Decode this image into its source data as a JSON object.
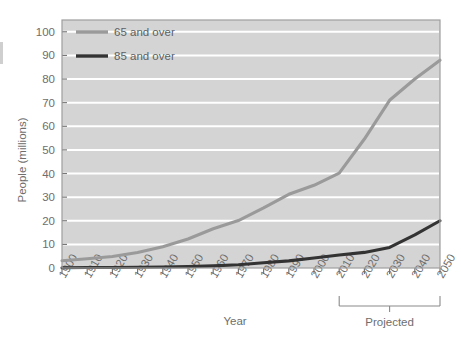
{
  "chart_data": {
    "type": "line",
    "title": "",
    "subtitle": "",
    "xlabel": "Year",
    "ylabel": "People (millions)",
    "xlim": [
      1900,
      2050
    ],
    "ylim": [
      0,
      105
    ],
    "ytick_step": 10,
    "grid": "horizontal-white",
    "legend_position": "top-left-inside",
    "plot_background": "#d4d4d4",
    "x": [
      1900,
      1910,
      1920,
      1930,
      1940,
      1950,
      1960,
      1970,
      1980,
      1990,
      2000,
      2010,
      2020,
      2030,
      2040,
      2050
    ],
    "xtick_labels": [
      "1900",
      "1910",
      "1920",
      "1930",
      "1940",
      "1950",
      "1960",
      "1970",
      "1980",
      "1990",
      "2000",
      "2010",
      "2020",
      "2030",
      "2040",
      "2050"
    ],
    "ytick_labels": [
      "0",
      "10",
      "20",
      "30",
      "40",
      "50",
      "60",
      "70",
      "80",
      "90",
      "100"
    ],
    "ytick_values": [
      0,
      10,
      20,
      30,
      40,
      50,
      60,
      70,
      80,
      90,
      100
    ],
    "series": [
      {
        "name": "65 and over",
        "color": "#9a9a9a",
        "width": 3.1,
        "values": [
          3.1,
          3.9,
          4.9,
          6.6,
          9.0,
          12.3,
          16.6,
          20.1,
          25.5,
          31.2,
          35.0,
          40.2,
          54.6,
          71.0,
          80.0,
          88.0
        ]
      },
      {
        "name": "85 and over",
        "color": "#333333",
        "width": 3.1,
        "values": [
          0.1,
          0.2,
          0.2,
          0.3,
          0.4,
          0.6,
          0.9,
          1.4,
          2.2,
          3.0,
          4.2,
          5.5,
          6.6,
          8.7,
          14.0,
          20.0
        ]
      }
    ],
    "annotations": [
      {
        "name": "projected-bracket",
        "label": "Projected",
        "from_x": 2010,
        "to_x": 2050
      }
    ]
  },
  "legend": {
    "items": [
      {
        "label": "65 and over",
        "color": "#9a9a9a"
      },
      {
        "label": "85 and over",
        "color": "#333333"
      }
    ]
  },
  "axes": {
    "x_title": "Year",
    "y_title": "People (millions)"
  },
  "colors": {
    "plot_bg": "#d4d4d4",
    "gridline": "#ffffff",
    "series_65": "#9a9a9a",
    "series_85": "#333333",
    "text": "#6e6e6e",
    "axis": "#777777"
  }
}
